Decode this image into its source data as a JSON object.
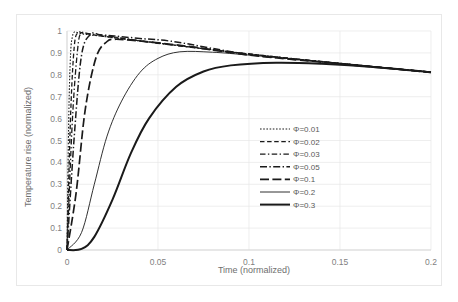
{
  "chart_data": {
    "type": "line",
    "title": "",
    "xlabel": "Time (normalized)",
    "ylabel": "Temperature rise (normalized)",
    "xlim": [
      0,
      0.2
    ],
    "ylim": [
      0,
      1
    ],
    "xticks": [
      "0",
      "0.05",
      "0.1",
      "0.15",
      "0.2"
    ],
    "xtick_values": [
      0,
      0.05,
      0.1,
      0.15,
      0.2
    ],
    "yticks": [
      "0",
      "0.1",
      "0.2",
      "0.3",
      "0.4",
      "0.5",
      "0.6",
      "0.7",
      "0.8",
      "0.9",
      "1"
    ],
    "ytick_values": [
      0,
      0.1,
      0.2,
      0.3,
      0.4,
      0.5,
      0.6,
      0.7,
      0.8,
      0.9,
      1
    ],
    "grid": true,
    "legend_position": "center-right",
    "line_color": "#1a1a1a",
    "grid_color": "#e6e6e6",
    "series": [
      {
        "name": "Φ=0.01",
        "phi": 0.01,
        "dash": "1.6,1.6",
        "width": 1.1,
        "peak_x": 0.004,
        "peak_y": 0.995,
        "end_y": 0.81,
        "values_x": [
          0,
          0.001,
          0.002,
          0.003,
          0.004,
          0.006,
          0.01,
          0.02,
          0.05,
          0.1,
          0.15,
          0.2
        ],
        "values_y": [
          0,
          0.62,
          0.9,
          0.975,
          0.995,
          0.992,
          0.985,
          0.975,
          0.945,
          0.895,
          0.852,
          0.812
        ]
      },
      {
        "name": "Φ=0.02",
        "phi": 0.02,
        "dash": "4.5,2.6",
        "width": 1.3,
        "peak_x": 0.006,
        "peak_y": 0.993,
        "end_y": 0.81,
        "values_x": [
          0,
          0.002,
          0.004,
          0.006,
          0.008,
          0.012,
          0.02,
          0.05,
          0.1,
          0.15,
          0.2
        ],
        "values_y": [
          0,
          0.62,
          0.93,
          0.993,
          0.992,
          0.986,
          0.976,
          0.945,
          0.895,
          0.852,
          0.812
        ]
      },
      {
        "name": "Φ=0.03",
        "phi": 0.03,
        "dash": "5.5,2.4,1.4,2.4",
        "width": 1.3,
        "peak_x": 0.008,
        "peak_y": 0.99,
        "end_y": 0.81,
        "values_x": [
          0,
          0.003,
          0.006,
          0.008,
          0.011,
          0.016,
          0.025,
          0.05,
          0.1,
          0.15,
          0.2
        ],
        "values_y": [
          0,
          0.6,
          0.93,
          0.99,
          0.989,
          0.984,
          0.974,
          0.944,
          0.895,
          0.852,
          0.812
        ]
      },
      {
        "name": "Φ=0.05",
        "phi": 0.05,
        "dash": "7,2.4,1.4,2.4",
        "width": 1.5,
        "peak_x": 0.013,
        "peak_y": 0.985,
        "end_y": 0.81,
        "values_x": [
          0,
          0.004,
          0.008,
          0.013,
          0.018,
          0.026,
          0.04,
          0.06,
          0.1,
          0.15,
          0.2
        ],
        "values_y": [
          0,
          0.52,
          0.89,
          0.985,
          0.983,
          0.977,
          0.966,
          0.95,
          0.893,
          0.851,
          0.812
        ]
      },
      {
        "name": "Φ=0.1",
        "phi": 0.1,
        "dash": "9,3.4",
        "width": 1.7,
        "peak_x": 0.026,
        "peak_y": 0.962,
        "end_y": 0.81,
        "values_x": [
          0,
          0.005,
          0.01,
          0.016,
          0.022,
          0.026,
          0.035,
          0.05,
          0.07,
          0.1,
          0.15,
          0.2
        ],
        "values_y": [
          0,
          0.26,
          0.64,
          0.88,
          0.952,
          0.962,
          0.958,
          0.946,
          0.926,
          0.89,
          0.85,
          0.811
        ]
      },
      {
        "name": "Φ=0.2",
        "phi": 0.2,
        "dash": "",
        "width": 0.9,
        "peak_x": 0.062,
        "peak_y": 0.905,
        "end_y": 0.81,
        "values_x": [
          0,
          0.008,
          0.015,
          0.022,
          0.03,
          0.04,
          0.05,
          0.062,
          0.08,
          0.1,
          0.13,
          0.16,
          0.2
        ],
        "values_y": [
          0,
          0.08,
          0.3,
          0.52,
          0.68,
          0.81,
          0.875,
          0.905,
          0.903,
          0.89,
          0.868,
          0.845,
          0.811
        ]
      },
      {
        "name": "Φ=0.3",
        "phi": 0.3,
        "dash": "",
        "width": 2.0,
        "peak_x": 0.115,
        "peak_y": 0.855,
        "end_y": 0.81,
        "values_x": [
          0,
          0.008,
          0.015,
          0.025,
          0.035,
          0.045,
          0.06,
          0.075,
          0.09,
          0.115,
          0.14,
          0.17,
          0.2
        ],
        "values_y": [
          0,
          0.005,
          0.06,
          0.23,
          0.44,
          0.6,
          0.745,
          0.815,
          0.843,
          0.855,
          0.85,
          0.835,
          0.812
        ]
      }
    ]
  }
}
